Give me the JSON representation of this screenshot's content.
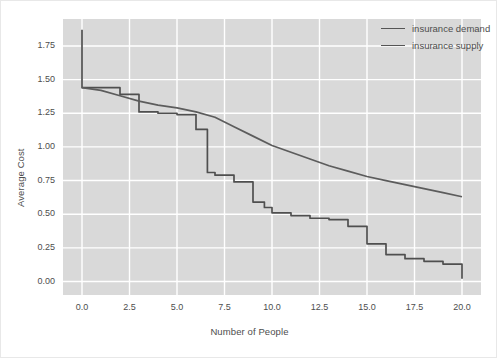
{
  "chart_data": {
    "type": "line",
    "title": "",
    "xlabel": "Number of People",
    "ylabel": "Average Cost",
    "xlim": [
      -1.0,
      21.0
    ],
    "ylim": [
      -0.1,
      1.95
    ],
    "grid": true,
    "legend_position": "top-right",
    "xticks": [
      "0.0",
      "2.5",
      "5.0",
      "7.5",
      "10.0",
      "12.5",
      "15.0",
      "17.5",
      "20.0"
    ],
    "xtick_values": [
      0.0,
      2.5,
      5.0,
      7.5,
      10.0,
      12.5,
      15.0,
      17.5,
      20.0
    ],
    "yticks": [
      "0.00",
      "0.25",
      "0.50",
      "0.75",
      "1.00",
      "1.25",
      "1.50",
      "1.75"
    ],
    "ytick_values": [
      0.0,
      0.25,
      0.5,
      0.75,
      1.0,
      1.25,
      1.5,
      1.75
    ],
    "colors": {
      "plot_background": "#d9d9d9",
      "figure_background": "#ffffff",
      "grid": "#ffffff",
      "demand_line": "#4f4f4f",
      "supply_line": "#5c5c5c",
      "text": "#4d4d4d"
    },
    "series": [
      {
        "name": "insurance demand",
        "drawstyle": "steps-post",
        "color": "#4f4f4f",
        "x": [
          0.0,
          0.0,
          1.0,
          2.0,
          3.0,
          4.0,
          5.0,
          6.0,
          6.6,
          7.0,
          8.0,
          9.0,
          9.6,
          10.0,
          11.0,
          12.0,
          13.0,
          14.0,
          15.0,
          16.0,
          17.0,
          18.0,
          19.0,
          20.0
        ],
        "y": [
          1.87,
          1.44,
          1.44,
          1.39,
          1.26,
          1.25,
          1.24,
          1.13,
          0.81,
          0.79,
          0.74,
          0.59,
          0.55,
          0.51,
          0.49,
          0.47,
          0.46,
          0.41,
          0.28,
          0.2,
          0.17,
          0.15,
          0.13,
          0.02
        ]
      },
      {
        "name": "insurance supply",
        "drawstyle": "default",
        "color": "#5c5c5c",
        "x": [
          0.0,
          1.0,
          2.0,
          3.0,
          4.0,
          5.0,
          6.0,
          7.0,
          8.0,
          9.0,
          10.0,
          11.0,
          12.0,
          13.0,
          14.0,
          15.0,
          16.0,
          17.0,
          18.0,
          19.0,
          20.0
        ],
        "y": [
          1.44,
          1.42,
          1.38,
          1.34,
          1.31,
          1.29,
          1.26,
          1.22,
          1.15,
          1.08,
          1.01,
          0.96,
          0.91,
          0.86,
          0.82,
          0.78,
          0.75,
          0.72,
          0.69,
          0.66,
          0.63
        ]
      }
    ]
  },
  "legend": {
    "entries": [
      {
        "label": "insurance demand"
      },
      {
        "label": "insurance supply"
      }
    ]
  }
}
